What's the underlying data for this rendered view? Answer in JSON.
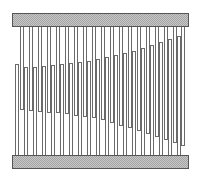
{
  "diagram": {
    "title": "",
    "colors": {
      "outline": "#6a6a6a",
      "plate_fill": "#c8c8c8",
      "plate_border": "#555555",
      "background": "#ffffff"
    },
    "top_plate": {
      "x": 12,
      "y": 13,
      "width": 177,
      "height": 14
    },
    "bottom_plate": {
      "x": 12,
      "y": 155,
      "width": 177,
      "height": 14
    },
    "finger_width": 4,
    "top_fingers": [
      {
        "x": 20,
        "bottom": 110
      },
      {
        "x": 29,
        "bottom": 111
      },
      {
        "x": 38,
        "bottom": 112
      },
      {
        "x": 47,
        "bottom": 113
      },
      {
        "x": 56,
        "bottom": 113
      },
      {
        "x": 65,
        "bottom": 114
      },
      {
        "x": 74,
        "bottom": 116
      },
      {
        "x": 83,
        "bottom": 117
      },
      {
        "x": 92,
        "bottom": 118
      },
      {
        "x": 101,
        "bottom": 120
      },
      {
        "x": 110,
        "bottom": 123
      },
      {
        "x": 119,
        "bottom": 126
      },
      {
        "x": 128,
        "bottom": 128
      },
      {
        "x": 137,
        "bottom": 131
      },
      {
        "x": 146,
        "bottom": 134
      },
      {
        "x": 155,
        "bottom": 137
      },
      {
        "x": 164,
        "bottom": 140
      },
      {
        "x": 173,
        "bottom": 143
      },
      {
        "x": 181,
        "bottom": 146
      }
    ],
    "bottom_fingers": [
      {
        "x": 15,
        "top": 64
      },
      {
        "x": 24,
        "top": 67
      },
      {
        "x": 33,
        "top": 67
      },
      {
        "x": 42,
        "top": 66
      },
      {
        "x": 51,
        "top": 65
      },
      {
        "x": 60,
        "top": 64
      },
      {
        "x": 69,
        "top": 63
      },
      {
        "x": 78,
        "top": 62
      },
      {
        "x": 87,
        "top": 61
      },
      {
        "x": 96,
        "top": 59
      },
      {
        "x": 105,
        "top": 57
      },
      {
        "x": 114,
        "top": 55
      },
      {
        "x": 123,
        "top": 53
      },
      {
        "x": 132,
        "top": 51
      },
      {
        "x": 141,
        "top": 48
      },
      {
        "x": 150,
        "top": 45
      },
      {
        "x": 159,
        "top": 42
      },
      {
        "x": 168,
        "top": 39
      },
      {
        "x": 177,
        "top": 36
      }
    ]
  }
}
